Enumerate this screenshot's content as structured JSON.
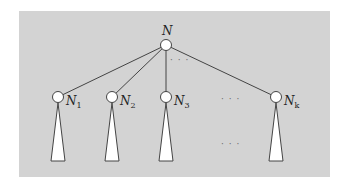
{
  "diagram": {
    "type": "tree",
    "background_color": "#d3d3d3",
    "root": {
      "label": "N",
      "x": 166,
      "y": 45
    },
    "children": [
      {
        "label": "N",
        "subscript": "1",
        "x": 58,
        "y": 97
      },
      {
        "label": "N",
        "subscript": "2",
        "x": 112,
        "y": 97
      },
      {
        "label": "N",
        "subscript": "3",
        "x": 166,
        "y": 97
      },
      {
        "label": "N",
        "subscript": "k",
        "x": 276,
        "y": 97
      }
    ],
    "ellipses": {
      "below_root": "· · ·",
      "between_children": "· · ·",
      "between_subtrees": "· · ·"
    },
    "subtree_shape": "triangle"
  }
}
